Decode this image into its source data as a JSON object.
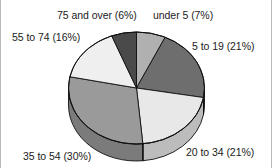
{
  "chart_data": {
    "type": "pie",
    "title": "",
    "subtitle": "",
    "xlabel": "",
    "ylabel": "",
    "legend_position": "none",
    "grid": false,
    "style": "3d-extruded-pie",
    "start_angle_deg": 0,
    "direction": "clockwise",
    "categories": [
      "under 5",
      "5 to 19",
      "20 to 34",
      "35 to 54",
      "55 to 74",
      "75 and over"
    ],
    "values": [
      7,
      21,
      21,
      30,
      16,
      6
    ],
    "value_unit": "percent",
    "labels": [
      "under 5 (7%)",
      "5 to 19 (21%)",
      "20 to 34 (21%)",
      "35 to 54 (30%)",
      "55 to 74 (16%)",
      "75 and over (6%)"
    ],
    "slice_colors": [
      "#b0b0b0",
      "#6e6e6e",
      "#e8e8e8",
      "#9a9a9a",
      "#efefef",
      "#4a4a4a"
    ],
    "slice_side_colors": [
      "#8c8c8c",
      "#565656",
      "#bcbcbc",
      "#7b7b7b",
      "#c2c2c2",
      "#3a3a3a"
    ]
  },
  "figure": {
    "border_color": "#b9b9b9",
    "background": "#ffffff",
    "text_color": "#1b1b1b",
    "outline_color": "#111111"
  },
  "annotations": {
    "under_5": "under 5 (7%)",
    "age_5_to_19": "5 to 19 (21%)",
    "age_20_to_34": "20 to 34 (21%)",
    "age_35_to_54": "35 to 54 (30%)",
    "age_55_to_74": "55 to 74 (16%)",
    "age_75_and_over": "75 and over (6%)"
  }
}
